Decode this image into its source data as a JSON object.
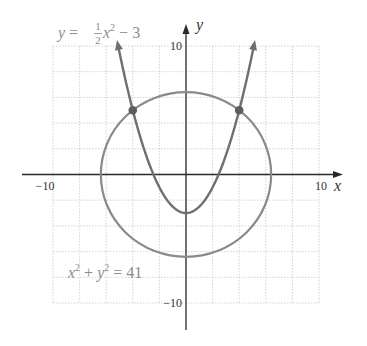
{
  "chart_data": {
    "type": "line",
    "title": "",
    "xlabel": "x",
    "ylabel": "y",
    "xlim": [
      -10,
      10
    ],
    "ylim": [
      -10,
      10
    ],
    "grid": true,
    "grid_step": 2,
    "x_tick_labels": [
      {
        "value": -10,
        "label": "−10"
      },
      {
        "value": 10,
        "label": "10"
      }
    ],
    "y_tick_labels": [
      {
        "value": 10,
        "label": "10"
      },
      {
        "value": -10,
        "label": "−10"
      }
    ],
    "series": [
      {
        "name": "parabola",
        "equation": "y = (1/2)x^2 − 3",
        "label_parts": {
          "lhs": "y",
          "eq": " = ",
          "num": "1",
          "den": "2",
          "var": "x",
          "exp": "2",
          "rest": " − 3"
        },
        "x_range": [
          -5.1,
          5.1
        ],
        "arrows": true,
        "color": "#6f6f6f"
      },
      {
        "name": "circle",
        "equation": "x^2 + y^2 = 41",
        "label_parts": {
          "x": "x",
          "x_exp": "2",
          "plus": " + ",
          "y": "y",
          "y_exp": "2",
          "rest": " = 41"
        },
        "radius_squared": 41,
        "color": "#8a8a8a"
      }
    ],
    "intersection_points": [
      {
        "x": -4,
        "y": 5
      },
      {
        "x": 4,
        "y": 5
      }
    ]
  }
}
